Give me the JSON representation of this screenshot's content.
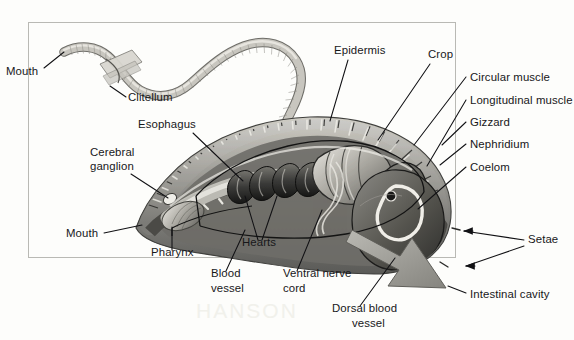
{
  "figure": {
    "kind": "anatomical-diagram",
    "background_color": "#fdfdfb",
    "ink_color": "#17171a",
    "frame_color": "#b9b9b4",
    "frame": {
      "x": 28,
      "y": 22,
      "width": 428,
      "height": 236
    }
  },
  "labels": [
    {
      "id": "mouth-top",
      "text": "Mouth",
      "x": 6,
      "y": 75,
      "anchor": "start"
    },
    {
      "id": "clitellum",
      "text": "Clitellum",
      "x": 128,
      "y": 101,
      "anchor": "start"
    },
    {
      "id": "esophagus",
      "text": "Esophagus",
      "x": 138,
      "y": 128,
      "anchor": "start"
    },
    {
      "id": "cerebral-ganglion-1",
      "text": "Cerebral",
      "x": 90,
      "y": 156,
      "anchor": "start"
    },
    {
      "id": "cerebral-ganglion-2",
      "text": "ganglion",
      "x": 90,
      "y": 170,
      "anchor": "start"
    },
    {
      "id": "mouth-bottom",
      "text": "Mouth",
      "x": 66,
      "y": 237,
      "anchor": "start"
    },
    {
      "id": "pharynx",
      "text": "Pharynx",
      "x": 151,
      "y": 256,
      "anchor": "start"
    },
    {
      "id": "hearts",
      "text": "Hearts",
      "x": 242,
      "y": 246,
      "anchor": "start"
    },
    {
      "id": "blood-vessel-1",
      "text": "Blood",
      "x": 211,
      "y": 277,
      "anchor": "start"
    },
    {
      "id": "blood-vessel-2",
      "text": "vessel",
      "x": 211,
      "y": 292,
      "anchor": "start"
    },
    {
      "id": "ventral-nerve-1",
      "text": "Ventral nerve",
      "x": 283,
      "y": 277,
      "anchor": "start"
    },
    {
      "id": "ventral-nerve-2",
      "text": "cord",
      "x": 283,
      "y": 292,
      "anchor": "start"
    },
    {
      "id": "dorsal-blood-1",
      "text": "Dorsal blood",
      "x": 332,
      "y": 312,
      "anchor": "start"
    },
    {
      "id": "dorsal-blood-2",
      "text": "vessel",
      "x": 352,
      "y": 327,
      "anchor": "start"
    },
    {
      "id": "epidermis",
      "text": "Epidermis",
      "x": 334,
      "y": 54,
      "anchor": "start"
    },
    {
      "id": "crop",
      "text": "Crop",
      "x": 428,
      "y": 58,
      "anchor": "start"
    },
    {
      "id": "circular-muscle",
      "text": "Circular muscle",
      "x": 470,
      "y": 81,
      "anchor": "start"
    },
    {
      "id": "longitudinal-muscle",
      "text": "Longitudinal muscle",
      "x": 470,
      "y": 104,
      "anchor": "start"
    },
    {
      "id": "gizzard",
      "text": "Gizzard",
      "x": 470,
      "y": 126,
      "anchor": "start"
    },
    {
      "id": "nephridium",
      "text": "Nephridium",
      "x": 470,
      "y": 148,
      "anchor": "start"
    },
    {
      "id": "coelom",
      "text": "Coelom",
      "x": 470,
      "y": 171,
      "anchor": "start"
    },
    {
      "id": "setae",
      "text": "Setae",
      "x": 528,
      "y": 243,
      "anchor": "start"
    },
    {
      "id": "intestinal-cavity",
      "text": "Intestinal cavity",
      "x": 470,
      "y": 298,
      "anchor": "start"
    }
  ],
  "leaders": [
    {
      "id": "leader-mouth-top",
      "path": "M 44 68 L 64 52"
    },
    {
      "id": "leader-clitellum",
      "path": "M 126 97 L 110 86"
    },
    {
      "id": "leader-esophagus",
      "path": "M 193 133 L 243 181"
    },
    {
      "id": "leader-cerebral-ganglion",
      "path": "M 131 174 L 168 198"
    },
    {
      "id": "leader-mouth-bottom",
      "path": "M 104 233 L 142 225"
    },
    {
      "id": "leader-pharynx",
      "path": "M 172 250 L 172 227"
    },
    {
      "id": "leader-hearts-a",
      "path": "M 258 240 L 245 196"
    },
    {
      "id": "leader-hearts-b",
      "path": "M 262 240 L 277 196"
    },
    {
      "id": "leader-blood-vessel",
      "path": "M 226 271 L 245 230"
    },
    {
      "id": "leader-ventral-nerve",
      "path": "M 297 271 L 322 210"
    },
    {
      "id": "leader-dorsal-blood",
      "path": "M 360 306 L 395 258"
    },
    {
      "id": "leader-epidermis",
      "path": "M 348 60 L 330 121"
    },
    {
      "id": "leader-crop",
      "path": "M 430 64 L 378 140"
    },
    {
      "id": "leader-circular-muscle",
      "path": "M 466 77 L 414 145"
    },
    {
      "id": "leader-longitudinal-muscle",
      "path": "M 466 100 L 427 166"
    },
    {
      "id": "leader-gizzard",
      "path": "M 466 122 L 442 145"
    },
    {
      "id": "leader-nephridium",
      "path": "M 466 144 L 440 165"
    },
    {
      "id": "leader-coelom",
      "path": "M 466 167 L 418 209"
    },
    {
      "id": "leader-setae-a",
      "path": "M 524 240 L 464 231"
    },
    {
      "id": "leader-setae-b",
      "path": "M 524 246 L 466 266"
    },
    {
      "id": "leader-intestinal-cavity",
      "path": "M 466 293 L 448 286"
    }
  ],
  "arrow_leaders": [
    {
      "id": "arrow-setae-upper",
      "tip": {
        "x": 464,
        "y": 231
      }
    },
    {
      "id": "arrow-setae-lower",
      "tip": {
        "x": 466,
        "y": 266
      }
    }
  ],
  "callout_arrow": {
    "id": "intestinal-cavity-arrow",
    "description": "large grey block arrow pointing down-right into intestinal cavity",
    "fill": "#9b9b96"
  },
  "bleed_text": "HANSON",
  "illustration": {
    "whole_worm": {
      "description": "whole earthworm seen from above, clitellum band near anterior",
      "fill": "#cfcdc6"
    },
    "cutaway": {
      "description": "large cutaway of anterior end showing segmented body wall and internal organs",
      "fill": "#6f6f6c"
    }
  }
}
